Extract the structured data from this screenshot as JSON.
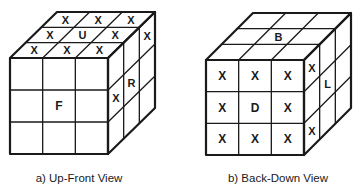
{
  "figure": {
    "panels": [
      {
        "id": "a",
        "caption": "a) Up-Front View",
        "faces": {
          "top": {
            "label": "U",
            "grid": [
              [
                "X",
                "X",
                "X"
              ],
              [
                "X",
                "U",
                "X"
              ],
              [
                "X",
                "X",
                "X"
              ]
            ]
          },
          "front": {
            "label": "F",
            "grid": [
              [
                "",
                "",
                ""
              ],
              [
                "",
                "F",
                ""
              ],
              [
                "",
                "",
                ""
              ]
            ]
          },
          "right": {
            "label": "R",
            "grid": [
              [
                "",
                "",
                "X"
              ],
              [
                "X",
                "R",
                ""
              ],
              [
                "",
                "",
                ""
              ]
            ]
          }
        }
      },
      {
        "id": "b",
        "caption": "b) Back-Down View",
        "faces": {
          "top": {
            "label": "B",
            "grid": [
              [
                "",
                "",
                ""
              ],
              [
                "",
                "B",
                ""
              ],
              [
                "",
                "",
                ""
              ]
            ]
          },
          "front": {
            "label": "D",
            "grid": [
              [
                "X",
                "X",
                "X"
              ],
              [
                "X",
                "D",
                "X"
              ],
              [
                "X",
                "X",
                "X"
              ]
            ]
          },
          "right": {
            "label": "L",
            "grid": [
              [
                "X",
                "",
                ""
              ],
              [
                "",
                "L",
                ""
              ],
              [
                "X",
                "",
                ""
              ]
            ]
          }
        }
      }
    ],
    "colors": {
      "ink": "#1a1a1a",
      "background": "#ffffff"
    }
  }
}
